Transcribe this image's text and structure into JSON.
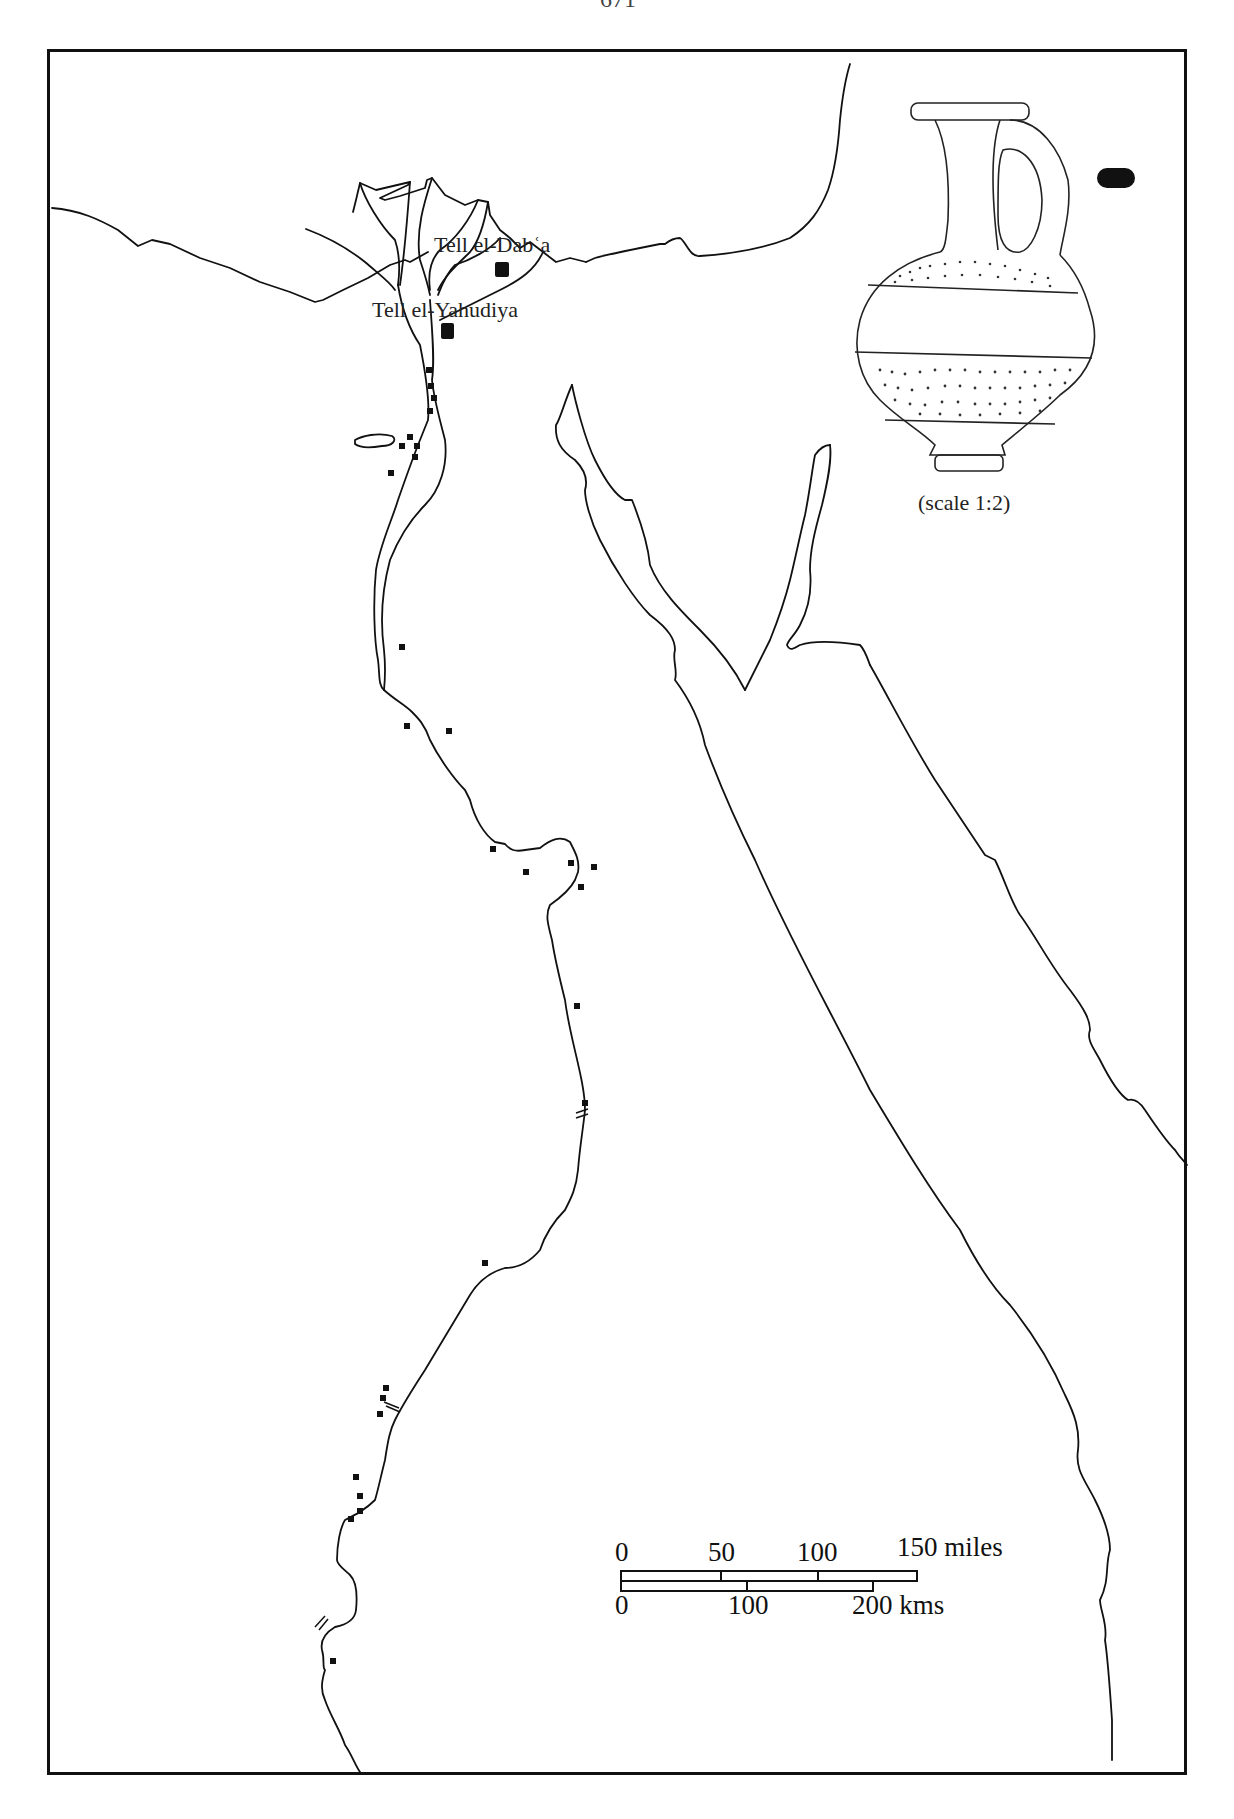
{
  "page": {
    "page_number": "671"
  },
  "map": {
    "sites": [
      {
        "name": "Tell el-Dabʿa",
        "label": "Tell el-Dabʿa"
      },
      {
        "name": "Tell el-Yahudiya",
        "label": "Tell el-Yahudiya"
      }
    ],
    "find_spot_markers_count": 34,
    "cataract_markers_count": 3
  },
  "inset": {
    "object": "juglet drawing",
    "caption": "(scale 1:2)"
  },
  "scale_bar": {
    "miles": {
      "ticks": [
        "0",
        "50",
        "100",
        "150 miles"
      ]
    },
    "kms": {
      "ticks": [
        "0",
        "100",
        "200 kms"
      ]
    }
  },
  "colors": {
    "ink": "#111111",
    "paper": "#ffffff"
  }
}
